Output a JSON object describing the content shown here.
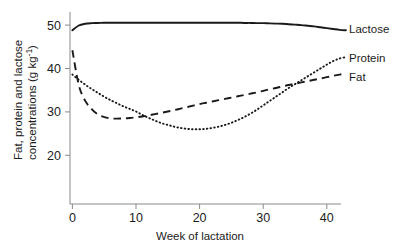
{
  "chart_data": {
    "type": "line",
    "title": "",
    "xlabel": "Week of lactation",
    "ylabel_line1": "Fat, protein and lactose",
    "ylabel_line2": "concentrations (g kg",
    "ylabel_exponent": "-1",
    "ylabel_close": ")",
    "xlim": [
      -1,
      43
    ],
    "ylim": [
      14,
      53
    ],
    "xticks": [
      0,
      10,
      20,
      30,
      40
    ],
    "xtick_labels": [
      "0",
      "10",
      "20",
      "30",
      "40"
    ],
    "yticks": [
      20,
      30,
      40,
      50
    ],
    "ytick_labels": [
      "20",
      "30",
      "40",
      "50"
    ],
    "grid": false,
    "legend_position": "right-outside",
    "x": [
      0,
      1,
      2,
      3,
      4,
      5,
      6,
      7,
      8,
      9,
      10,
      11,
      12,
      13,
      14,
      15,
      16,
      17,
      18,
      19,
      20,
      21,
      22,
      23,
      24,
      25,
      26,
      27,
      28,
      29,
      30,
      31,
      32,
      33,
      34,
      35,
      36,
      37,
      38,
      39,
      40,
      41,
      42,
      43
    ],
    "series": [
      {
        "name": "Lactose",
        "style": "solid",
        "color": "#1a1a1a",
        "values": [
          48.8,
          49.9,
          50.3,
          50.45,
          50.5,
          50.55,
          50.55,
          50.55,
          50.55,
          50.55,
          50.55,
          50.55,
          50.55,
          50.55,
          50.55,
          50.55,
          50.55,
          50.55,
          50.55,
          50.55,
          50.55,
          50.55,
          50.55,
          50.55,
          50.55,
          50.55,
          50.55,
          50.5,
          50.5,
          50.45,
          50.45,
          50.4,
          50.35,
          50.3,
          50.2,
          50.1,
          50.0,
          49.85,
          49.7,
          49.5,
          49.3,
          49.1,
          48.9,
          48.8
        ]
      },
      {
        "name": "Protein",
        "style": "dotted",
        "color": "#1a1a1a",
        "values": [
          38.6,
          37.4,
          36.3,
          35.3,
          34.4,
          33.5,
          32.7,
          32.0,
          31.3,
          30.7,
          30.1,
          29.3,
          28.6,
          28.0,
          27.4,
          27.0,
          26.6,
          26.3,
          26.1,
          26.0,
          26.0,
          26.1,
          26.3,
          26.6,
          27.0,
          27.5,
          28.1,
          28.8,
          29.6,
          30.5,
          31.5,
          32.5,
          33.5,
          34.5,
          35.5,
          36.4,
          37.3,
          38.2,
          39.1,
          40.0,
          40.9,
          41.7,
          42.3,
          42.6
        ]
      },
      {
        "name": "Fat",
        "style": "dashed",
        "color": "#1a1a1a",
        "values": [
          44.2,
          36.2,
          32.6,
          30.7,
          29.4,
          28.8,
          28.5,
          28.45,
          28.5,
          28.6,
          28.75,
          28.95,
          29.2,
          29.5,
          29.8,
          30.1,
          30.4,
          30.75,
          31.1,
          31.45,
          31.8,
          32.1,
          32.4,
          32.7,
          33.0,
          33.3,
          33.6,
          33.9,
          34.2,
          34.5,
          34.85,
          35.2,
          35.5,
          35.85,
          36.2,
          36.5,
          36.8,
          37.1,
          37.4,
          37.7,
          38.0,
          38.3,
          38.6,
          38.9
        ]
      }
    ],
    "annotations": {
      "protein_minimum_week": 19,
      "protein_minimum_value": 26.0,
      "fat_minimum_week": 7,
      "fat_minimum_value": 28.45,
      "fat_protein_crossing_week_early": 11,
      "fat_protein_crossing_week_late": 37.5
    }
  },
  "legend": {
    "items": [
      {
        "label": "Lactose",
        "style": "solid"
      },
      {
        "label": "Protein",
        "style": "dotted"
      },
      {
        "label": "Fat",
        "style": "dashed"
      }
    ]
  }
}
